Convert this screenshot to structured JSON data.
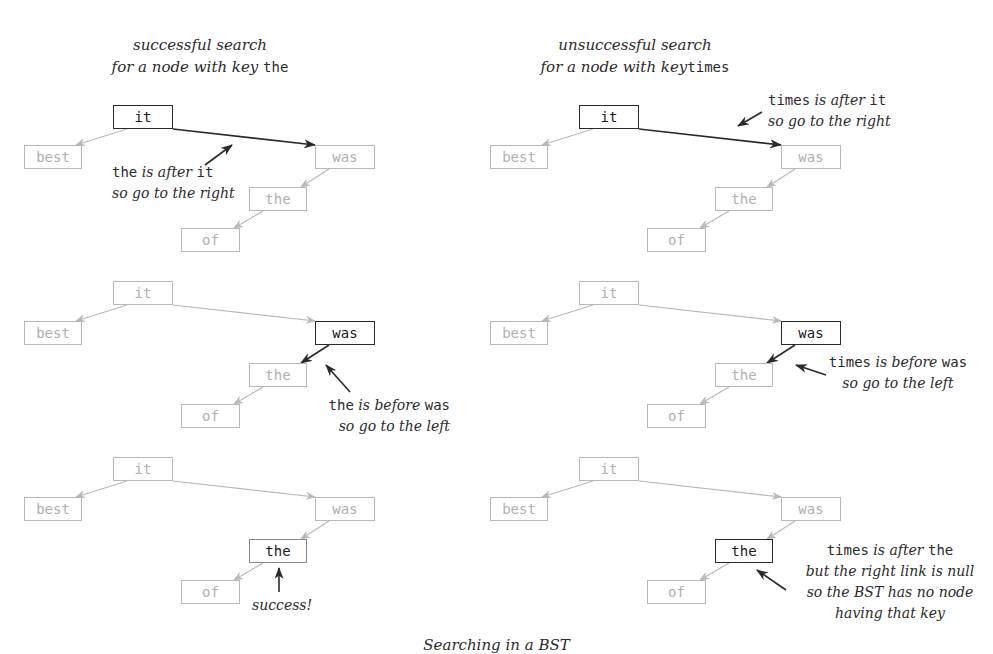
{
  "titles": {
    "left": {
      "line1": "successful search",
      "line2_prefix": "for a node with key",
      "line2_key": "the"
    },
    "right": {
      "line1": "unsuccessful search",
      "line2_prefix": "for a node with key",
      "line2_key": "times"
    }
  },
  "caption": "Searching in a BST",
  "colors": {
    "inactive_node_border": "#b8b8b8",
    "inactive_node_text": "#b0b0b0",
    "active_border": "#2a2a2a",
    "active_text": "#1a1a1a",
    "inactive_link": "#b8b8b8",
    "active_link": "#2a2a2a"
  },
  "tree": {
    "keys": [
      "it",
      "best",
      "was",
      "the",
      "of"
    ],
    "links": [
      [
        "it",
        "best"
      ],
      [
        "it",
        "was"
      ],
      [
        "was",
        "the"
      ],
      [
        "the",
        "of"
      ]
    ]
  },
  "panels": [
    {
      "id": "left-step1",
      "x": 0,
      "y": 0,
      "active_node": "it",
      "active_link": [
        "it",
        "was"
      ],
      "note": {
        "key": "the",
        "rel": "is after",
        "target": "it",
        "line2": "so go to the right"
      }
    },
    {
      "id": "left-step2",
      "x": 0,
      "y": 176,
      "active_node": "was",
      "active_link": [
        "was",
        "the"
      ],
      "note": {
        "key": "the",
        "rel": "is before",
        "target": "was",
        "line2": "so go to the left"
      }
    },
    {
      "id": "left-step3",
      "x": 0,
      "y": 352,
      "active_node": "the",
      "found": true,
      "note": {
        "line1": "success!"
      }
    },
    {
      "id": "right-step1",
      "x": 466,
      "y": 0,
      "active_node": "it",
      "active_link": [
        "it",
        "was"
      ],
      "note": {
        "key": "times",
        "rel": "is after",
        "target": "it",
        "line2": "so go to the right"
      }
    },
    {
      "id": "right-step2",
      "x": 466,
      "y": 176,
      "active_node": "was",
      "active_link": [
        "was",
        "the"
      ],
      "note": {
        "key": "times",
        "rel": "is before",
        "target": "was",
        "line2": "so go to the left"
      }
    },
    {
      "id": "right-step3",
      "x": 466,
      "y": 352,
      "active_node": "the",
      "note": {
        "key": "times",
        "rel": "is after",
        "target": "the",
        "line2": "but the right link is null",
        "line3": "so the BST has no node",
        "line4": "having that key"
      }
    }
  ]
}
